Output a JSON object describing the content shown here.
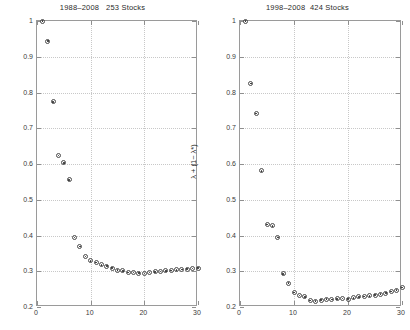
{
  "figure": {
    "width": 410,
    "height": 330,
    "background": "#ffffff",
    "axis_color": "#9a9a9a",
    "grid_color": "#c8c8c8",
    "marker_color": "#4a4a4a"
  },
  "chart_data": [
    {
      "type": "scatter",
      "panel": "left",
      "title": "1988–2008   253 Stocks",
      "xlabel": "",
      "ylabel": "λ + (1− λ*)",
      "xlim": [
        0,
        30
      ],
      "ylim": [
        0.2,
        1.0
      ],
      "xticks": [
        0,
        10,
        20,
        30
      ],
      "yticks": [
        0.2,
        0.3,
        0.4,
        0.5,
        0.6,
        0.7,
        0.8,
        0.9,
        1.0
      ],
      "xticklabels": [
        "0",
        "10",
        "20",
        "30"
      ],
      "yticklabels": [
        "0.2",
        "0.3",
        "0.4",
        "0.5",
        "0.6",
        "0.7",
        "0.8",
        "0.9",
        "1"
      ],
      "grid": true,
      "legend": "none",
      "marker": "circle-with-dot",
      "x": [
        1,
        2,
        3,
        4,
        5,
        6,
        7,
        8,
        9,
        10,
        11,
        12,
        13,
        14,
        15,
        16,
        17,
        18,
        19,
        20,
        21,
        22,
        23,
        24,
        25,
        26,
        27,
        28,
        29,
        30
      ],
      "y": [
        1.0,
        0.944,
        0.774,
        0.624,
        0.603,
        0.556,
        0.394,
        0.369,
        0.341,
        0.329,
        0.324,
        0.318,
        0.314,
        0.309,
        0.303,
        0.301,
        0.297,
        0.296,
        0.295,
        0.294,
        0.296,
        0.298,
        0.299,
        0.301,
        0.302,
        0.304,
        0.305,
        0.306,
        0.308,
        0.309
      ]
    },
    {
      "type": "scatter",
      "panel": "right",
      "title": "1998–2008  424 Stocks",
      "xlabel": "",
      "ylabel": "λ + (1− λ*)",
      "xlim": [
        0,
        30
      ],
      "ylim": [
        0.2,
        1.0
      ],
      "xticks": [
        0,
        10,
        20,
        30
      ],
      "yticks": [
        0.2,
        0.3,
        0.4,
        0.5,
        0.6,
        0.7,
        0.8,
        0.9,
        1.0
      ],
      "xticklabels": [
        "0",
        "10",
        "20",
        "30"
      ],
      "yticklabels": [
        "0.2",
        "0.3",
        "0.4",
        "0.5",
        "0.6",
        "0.7",
        "0.8",
        "0.9",
        "1"
      ],
      "grid": true,
      "legend": "none",
      "marker": "circle-with-dot",
      "x": [
        1,
        2,
        3,
        4,
        5,
        6,
        7,
        8,
        9,
        10,
        11,
        12,
        13,
        14,
        15,
        16,
        17,
        18,
        19,
        20,
        21,
        22,
        23,
        24,
        25,
        26,
        27,
        28,
        29,
        30
      ],
      "y": [
        1.0,
        0.825,
        0.741,
        0.581,
        0.431,
        0.427,
        0.394,
        0.293,
        0.267,
        0.241,
        0.232,
        0.228,
        0.218,
        0.216,
        0.219,
        0.222,
        0.221,
        0.223,
        0.224,
        0.222,
        0.226,
        0.228,
        0.229,
        0.231,
        0.233,
        0.236,
        0.239,
        0.243,
        0.247,
        0.254
      ]
    }
  ]
}
